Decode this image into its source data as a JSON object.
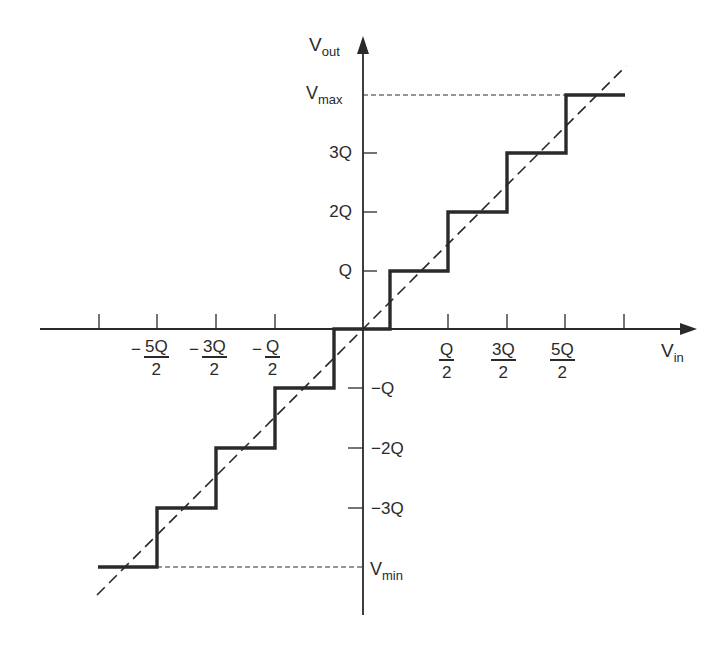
{
  "diagram": {
    "axes": {
      "x_label": "V",
      "x_label_sub": "in",
      "y_label": "V",
      "y_label_sub": "out"
    },
    "y_ticks_positive": [
      {
        "label": "Q"
      },
      {
        "label": "2Q"
      },
      {
        "label": "3Q"
      }
    ],
    "y_ticks_negative": [
      {
        "label": "−Q"
      },
      {
        "label": "−2Q"
      },
      {
        "label": "−3Q"
      }
    ],
    "y_limits": {
      "max_label": "V",
      "max_sub": "max",
      "min_label": "V",
      "min_sub": "min"
    },
    "x_ticks_negative": [
      {
        "sign": "−",
        "num": "5Q",
        "den": "2"
      },
      {
        "sign": "−",
        "num": "3Q",
        "den": "2"
      },
      {
        "sign": "−",
        "num": "Q",
        "den": "2"
      }
    ],
    "x_ticks_positive": [
      {
        "num": "Q",
        "den": "2"
      },
      {
        "num": "3Q",
        "den": "2"
      },
      {
        "num": "5Q",
        "den": "2"
      }
    ],
    "series": [
      {
        "name": "quantizer staircase",
        "style": "solid-thick"
      },
      {
        "name": "ideal linear response",
        "style": "dashed"
      }
    ],
    "colors": {
      "ink": "#2a2a2a",
      "background": "#ffffff"
    }
  }
}
